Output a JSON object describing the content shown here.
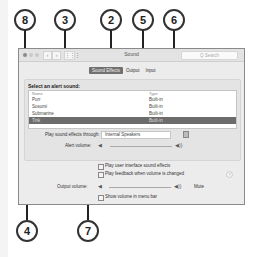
{
  "window": {
    "title": "Sound",
    "search_placeholder": "Q Search",
    "nav": {
      "back": "‹",
      "forward": "›",
      "grid": "⋮⋮⋮"
    }
  },
  "tabs": [
    {
      "label": "Sound Effects",
      "active": true
    },
    {
      "label": "Output",
      "active": false
    },
    {
      "label": "Input",
      "active": false
    }
  ],
  "alert_panel": {
    "title": "Select an alert sound:",
    "columns": [
      "Name",
      "Type"
    ],
    "rows": [
      {
        "name": "Purr",
        "type": "Built-in",
        "selected": false
      },
      {
        "name": "Sosumi",
        "type": "Built-in",
        "selected": false
      },
      {
        "name": "Submarine",
        "type": "Built-in",
        "selected": false
      },
      {
        "name": "Tink",
        "type": "Built-in",
        "selected": true
      }
    ]
  },
  "play_through": {
    "label": "Play sound effects through:",
    "value": "Internal Speakers"
  },
  "alert_volume": {
    "label": "Alert volume:",
    "level_percent": 90
  },
  "checkboxes": [
    {
      "label": "Play user interface sound effects"
    },
    {
      "label": "Play feedback when volume is changed"
    }
  ],
  "output_volume": {
    "label": "Output volume:",
    "mute_label": "Mute",
    "level_percent": 100
  },
  "menu_bar_checkbox": {
    "label": "Show volume in menu bar"
  },
  "help_label": "?",
  "callouts": [
    {
      "number": "8"
    },
    {
      "number": "3"
    },
    {
      "number": "2"
    },
    {
      "number": "5"
    },
    {
      "number": "6"
    },
    {
      "number": "4"
    },
    {
      "number": "7"
    }
  ],
  "colors": {
    "selected_row": "#6c6c6c",
    "active_tab": "#707070",
    "callout_border": "#333333"
  }
}
